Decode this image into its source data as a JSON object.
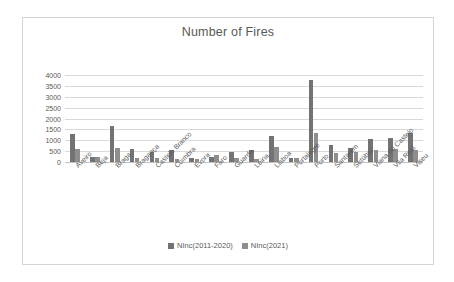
{
  "chart_data": {
    "type": "bar",
    "title": "Number of Fires",
    "xlabel": "",
    "ylabel": "",
    "ylim": [
      0,
      4000
    ],
    "ytick_step": 500,
    "yticks": [
      0,
      500,
      1000,
      1500,
      2000,
      2500,
      3000,
      3500,
      4000
    ],
    "ytick_labels": [
      "0",
      "500",
      "1000",
      "1500",
      "2000",
      "2500",
      "3000",
      "3500",
      "4000"
    ],
    "grid": true,
    "legend_position": "bottom",
    "categories": [
      "Aveiro",
      "Beja",
      "Braga",
      "Bragança",
      "Castelo Branco",
      "Coimbra",
      "Évora",
      "Faro",
      "Guarda",
      "Leiria",
      "Lisboa",
      "Portalegre",
      "Porto",
      "Santarém",
      "Setúbal",
      "Viana do Castelo",
      "Vila Real",
      "Viseu"
    ],
    "series": [
      {
        "name": "NInc(2011-2020)",
        "color": "#737373",
        "values": [
          1290,
          230,
          1650,
          580,
          450,
          540,
          180,
          210,
          450,
          560,
          1190,
          200,
          3750,
          780,
          650,
          1080,
          1100,
          1330
        ]
      },
      {
        "name": "NInc(2021)",
        "color": "#8e8e8e",
        "values": [
          610,
          250,
          660,
          200,
          180,
          150,
          160,
          300,
          200,
          130,
          680,
          180,
          1330,
          400,
          460,
          550,
          590,
          540
        ]
      }
    ]
  },
  "legend": {
    "entries": [
      {
        "label": "NInc(2011-2020)"
      },
      {
        "label": "NInc(2021)"
      }
    ]
  }
}
